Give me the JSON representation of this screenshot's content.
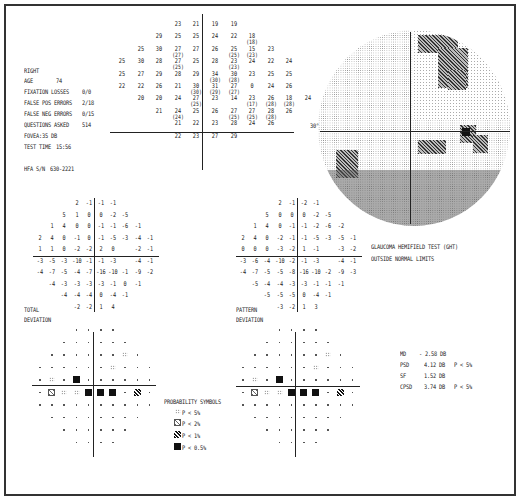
{
  "header": {
    "eye": "RIGHT",
    "age_label": "AGE",
    "age_value": "74",
    "fixation_label": "FIXATION LOSSES",
    "fixation_value": "0/0",
    "false_pos_label": "FALSE POS ERRORS",
    "false_pos_value": "2/18",
    "false_neg_label": "FALSE NEG ERRORS",
    "false_neg_value": "0/15",
    "questions_label": "QUESTIONS ASKED",
    "questions_value": "514",
    "fovea_label": "FOVEA:",
    "fovea_value": "35 DB",
    "test_time_label": "TEST TIME",
    "test_time_value": "15:56",
    "serial_label": "HFA S/N",
    "serial_value": "630-2221"
  },
  "threshold_grid": {
    "rows": [
      [
        null,
        null,
        null,
        "23",
        "21",
        "19",
        "19",
        null,
        null,
        null
      ],
      [
        null,
        null,
        "29",
        "25",
        "25",
        "24",
        "22",
        "18(18)",
        null,
        null
      ],
      [
        null,
        "25",
        "30",
        "27(27)",
        "27",
        "26",
        "25(25)",
        "15(23)",
        "23",
        null
      ],
      [
        "25",
        "30",
        "28",
        "27(25)",
        "25",
        "28",
        "23(23)",
        "24",
        "22",
        "24"
      ],
      [
        "25",
        "27",
        "29",
        "28",
        "29",
        "34(30)",
        "30(28)",
        "23",
        "25",
        "25"
      ],
      [
        "22",
        "22",
        "26",
        "21",
        "30(30)",
        "31(29)",
        "27(27)",
        "0",
        "24",
        "26"
      ],
      [
        null,
        "20",
        "20",
        "24",
        "27(25)",
        "23",
        "14",
        "23(17)",
        "26(28)",
        "18(28)",
        "24"
      ],
      [
        null,
        null,
        "21",
        "24(24)",
        "25",
        "26",
        "27(25)",
        "27(25)",
        "28(28)",
        "26"
      ],
      [
        null,
        null,
        null,
        "21",
        "22",
        "23",
        "28",
        "24",
        "26",
        null
      ],
      [
        null,
        null,
        null,
        "22",
        "23",
        "27",
        "29",
        null,
        null,
        null
      ]
    ]
  },
  "gray_map": {
    "axis_label": "30°"
  },
  "total_deviation": {
    "label_line1": "TOTAL",
    "label_line2": "DEVIATION",
    "rows": [
      [
        "",
        "",
        "",
        "2",
        "-1",
        "-1",
        "-1",
        "",
        "",
        ""
      ],
      [
        "",
        "",
        "5",
        "1",
        "0",
        "0",
        "-2",
        "-5",
        "",
        ""
      ],
      [
        "",
        "1",
        "4",
        "0",
        "0",
        "-1",
        "-1",
        "-6",
        "-1",
        ""
      ],
      [
        "2",
        "4",
        "0",
        "-1",
        "0",
        "-1",
        "-5",
        "-3",
        "-4",
        "-1"
      ],
      [
        "1",
        "1",
        "0",
        "-2",
        "-2",
        "2",
        "0",
        "",
        "-2",
        "-1"
      ],
      [
        "-3",
        "-5",
        "-3",
        "-10",
        "-1",
        "-1",
        "-3",
        "",
        "-4",
        "-1"
      ],
      [
        "-4",
        "-7",
        "-5",
        "-4",
        "-7",
        "-16",
        "-10",
        "-1",
        "-9",
        "-2"
      ],
      [
        "",
        "-4",
        "-3",
        "-3",
        "-3",
        "-3",
        "-1",
        "0",
        "-1",
        ""
      ],
      [
        "",
        "",
        "-4",
        "-4",
        "-4",
        "0",
        "-4",
        "-1",
        "",
        ""
      ],
      [
        "",
        "",
        "",
        "-2",
        "-2",
        "1",
        "4",
        "",
        "",
        ""
      ]
    ]
  },
  "pattern_deviation": {
    "label_line1": "PATTERN",
    "label_line2": "DEVIATION",
    "rows": [
      [
        "",
        "",
        "",
        "2",
        "-1",
        "-2",
        "-1",
        "",
        "",
        ""
      ],
      [
        "",
        "",
        "5",
        "0",
        "0",
        "0",
        "-2",
        "-5",
        "",
        ""
      ],
      [
        "",
        "1",
        "4",
        "0",
        "-1",
        "-1",
        "-2",
        "-6",
        "-2",
        ""
      ],
      [
        "2",
        "4",
        "0",
        "-2",
        "-1",
        "-1",
        "-5",
        "-3",
        "-5",
        "-1"
      ],
      [
        "0",
        "0",
        "0",
        "-3",
        "-2",
        "1",
        "-1",
        "",
        "-3",
        "-2"
      ],
      [
        "-3",
        "-6",
        "-4",
        "-10",
        "-2",
        "-1",
        "-3",
        "",
        "-4",
        "-1"
      ],
      [
        "-4",
        "-7",
        "-5",
        "-5",
        "-8",
        "-16",
        "-10",
        "-2",
        "-9",
        "-3"
      ],
      [
        "",
        "-5",
        "-4",
        "-4",
        "-3",
        "-3",
        "-1",
        "-1",
        "-1",
        ""
      ],
      [
        "",
        "",
        "-5",
        "-5",
        "-5",
        "0",
        "-4",
        "-1",
        "",
        ""
      ],
      [
        "",
        "",
        "",
        "-3",
        "-2",
        "1",
        "3",
        "",
        "",
        ""
      ]
    ]
  },
  "ght": {
    "line1": "GLAUCOMA HEMIFIELD TEST (GHT)",
    "line2": "OUTSIDE NORMAL LIMITS"
  },
  "global_indices": [
    {
      "label": "MD",
      "value": "- 2.58 DB",
      "p": ""
    },
    {
      "label": "PSD",
      "value": "4.12 DB",
      "p": "P <  5%"
    },
    {
      "label": "SF",
      "value": "1.52 DB",
      "p": ""
    },
    {
      "label": "CPSD",
      "value": "3.74 DB",
      "p": "P <  5%"
    }
  ],
  "probability_symbols": {
    "title": "PROBABILITY SYMBOLS",
    "items": [
      {
        "symbol": "dots",
        "text": "P <  5%"
      },
      {
        "symbol": "light-hatch",
        "text": "P <  2%"
      },
      {
        "symbol": "dark-hatch",
        "text": "P <  1%"
      },
      {
        "symbol": "black-square",
        "text": "P < 0.5%"
      }
    ]
  }
}
